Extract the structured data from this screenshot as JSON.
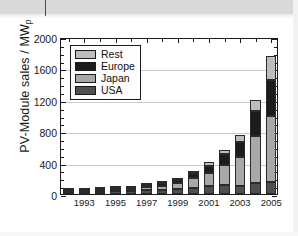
{
  "figure": {
    "background_color": "#ffffff",
    "scan_band_color": "#d9d9d9"
  },
  "chart_data": {
    "type": "bar",
    "stacked": true,
    "title": "",
    "subtitle": "",
    "xlabel": "",
    "ylabel": "PV-Module sales / MW",
    "ylabel_subscript": "p",
    "ylim": [
      0,
      2000
    ],
    "ytick_step": 400,
    "yticks": [
      0,
      400,
      800,
      1200,
      1600,
      2000
    ],
    "ytick_labels": [
      "0",
      "400",
      "800",
      "1200",
      "1600",
      "2000"
    ],
    "yminor_step": 100,
    "grid": true,
    "grid_axis": "y",
    "grid_color": "#c9c9c9",
    "legend_position": "upper left",
    "x": [
      1992,
      1993,
      1994,
      1995,
      1996,
      1997,
      1998,
      1999,
      2000,
      2001,
      2002,
      2003,
      2004,
      2005
    ],
    "categories": [
      "1992",
      "1993",
      "1994",
      "1995",
      "1996",
      "1997",
      "1998",
      "1999",
      "2000",
      "2001",
      "2002",
      "2003",
      "2004",
      "2005"
    ],
    "xtick_labels_shown": [
      "1993",
      "1995",
      "1997",
      "1999",
      "2001",
      "2003",
      "2005"
    ],
    "stack_order_bottom_to_top": [
      "USA",
      "Japan",
      "Europe",
      "Rest"
    ],
    "series": [
      {
        "name": "USA",
        "color": "#4f4f4f",
        "values": [
          18,
          21,
          26,
          35,
          39,
          51,
          54,
          61,
          75,
          100,
          121,
          103,
          139,
          153
        ]
      },
      {
        "name": "Japan",
        "color": "#a8a8a8",
        "values": [
          19,
          17,
          17,
          16,
          21,
          35,
          49,
          80,
          129,
          171,
          251,
          364,
          602,
          837
        ]
      },
      {
        "name": "Europe",
        "color": "#1c1c1c",
        "values": [
          16,
          16,
          17,
          20,
          19,
          30,
          34,
          40,
          61,
          86,
          135,
          193,
          314,
          460
        ]
      },
      {
        "name": "Rest",
        "color": "#bdbdbd",
        "values": [
          5,
          6,
          9,
          9,
          11,
          14,
          18,
          22,
          28,
          45,
          55,
          90,
          145,
          310
        ]
      }
    ],
    "totals": [
      58,
      60,
      69,
      80,
      90,
      130,
      155,
      203,
      293,
      402,
      562,
      750,
      1200,
      1760
    ]
  },
  "legend": {
    "entries": [
      {
        "label": "Rest",
        "color": "#bdbdbd"
      },
      {
        "label": "Europe",
        "color": "#1c1c1c"
      },
      {
        "label": "Japan",
        "color": "#a8a8a8"
      },
      {
        "label": "USA",
        "color": "#4f4f4f"
      }
    ]
  }
}
